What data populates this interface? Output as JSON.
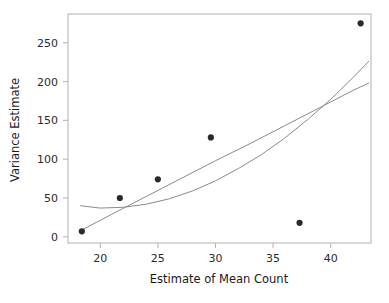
{
  "chart_data": {
    "type": "scatter",
    "title": "",
    "xlabel": "Estimate of Mean Count",
    "ylabel": "Variance Estimate",
    "xlim": [
      17.2,
      43.5
    ],
    "ylim": [
      -8,
      287
    ],
    "xticks": [
      20,
      25,
      30,
      35,
      40
    ],
    "xtick_labels": [
      "20",
      "25",
      "30",
      "35",
      "40"
    ],
    "yticks": [
      0,
      50,
      100,
      150,
      200,
      250
    ],
    "ytick_labels": [
      "0",
      "50",
      "100",
      "150",
      "200",
      "250"
    ],
    "grid": false,
    "legend": "none",
    "marker": "filled-circle",
    "marker_color": "#2a2a2a",
    "points": [
      {
        "x": 18.4,
        "y": 7
      },
      {
        "x": 21.7,
        "y": 50
      },
      {
        "x": 25.0,
        "y": 74
      },
      {
        "x": 29.6,
        "y": 128
      },
      {
        "x": 37.3,
        "y": 18
      },
      {
        "x": 42.6,
        "y": 275
      }
    ],
    "series": [
      {
        "name": "linear-fit",
        "type": "line",
        "color": "#8a8a8a",
        "x": [
          18.3,
          21.0,
          24.0,
          27.0,
          30.0,
          33.0,
          36.0,
          39.0,
          42.0,
          43.3
        ],
        "y": [
          8,
          29,
          52,
          75,
          98,
          120,
          143,
          166,
          189,
          198
        ]
      },
      {
        "name": "quadratic-fit",
        "type": "line",
        "color": "#8a8a8a",
        "x": [
          18.3,
          20.0,
          22.0,
          24.0,
          26.0,
          28.0,
          30.0,
          32.0,
          34.0,
          36.0,
          38.0,
          40.0,
          42.0,
          43.3
        ],
        "y": [
          40,
          37,
          38,
          42,
          49,
          59,
          72,
          88,
          106,
          127,
          151,
          177,
          206,
          226
        ]
      }
    ]
  },
  "axes": {
    "x_title": "Estimate of Mean Count",
    "y_title": "Variance Estimate"
  },
  "colors": {
    "frame": "#b8b8b8",
    "curve": "#8a8a8a",
    "marker": "#2a2a2a",
    "text": "#1f1f1f",
    "background": "#ffffff"
  }
}
